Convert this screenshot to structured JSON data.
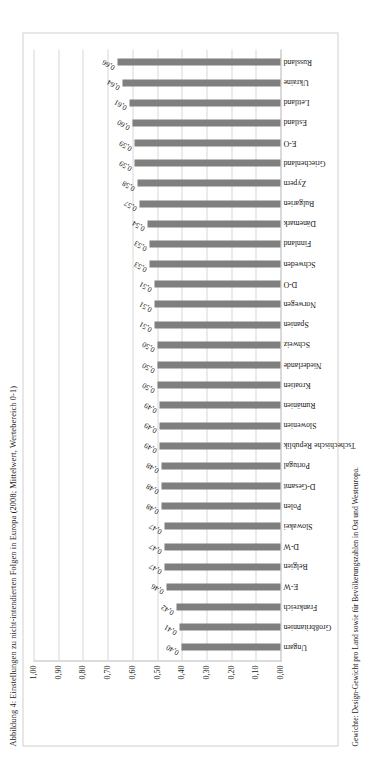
{
  "figure": {
    "title": "Abbildung 4: Einstellungen zu nicht-intendierten Folgen in Europa (2008; Mittelwert, Wertebereich 0-1)",
    "note": "Gewichte: Design-Gewicht pro Land sowie für Bevölkerungszahlen in Ost und Westeuropa."
  },
  "chart_data": {
    "type": "bar",
    "title": "Abbildung 4: Einstellungen zu nicht-intendierten Folgen in Europa (2008; Mittelwert, Wertebereich 0-1)",
    "xlabel": "",
    "ylabel": "",
    "ylim": [
      0,
      1.0
    ],
    "grid": true,
    "legend": false,
    "bar_color": "#7f7f7f",
    "decimal_separator": ",",
    "ytick_labels": [
      "0,00",
      "0,10",
      "0,20",
      "0,30",
      "0,40",
      "0,50",
      "0,60",
      "0,70",
      "0,80",
      "0,90",
      "1,00"
    ],
    "yticks": [
      0.0,
      0.1,
      0.2,
      0.3,
      0.4,
      0.5,
      0.6,
      0.7,
      0.8,
      0.9,
      1.0
    ],
    "categories": [
      "Ungarn",
      "Großbritannien",
      "Frankreich",
      "E-W",
      "Belgien",
      "D-W",
      "Slowakei",
      "Polen",
      "D-Gesamt",
      "Portugal",
      "Tschechische Republik",
      "Slowenien",
      "Rumänien",
      "Kroatien",
      "Niederlande",
      "Schweiz",
      "Spanien",
      "Norwegen",
      "D-O",
      "Schweden",
      "Finnland",
      "Dänemark",
      "Bulgarien",
      "Zypern",
      "Griechenland",
      "E-O",
      "Estland",
      "Lettland",
      "Ukraine",
      "Russland"
    ],
    "values": [
      0.4,
      0.41,
      0.42,
      0.46,
      0.47,
      0.47,
      0.47,
      0.48,
      0.48,
      0.48,
      0.49,
      0.49,
      0.49,
      0.5,
      0.5,
      0.5,
      0.51,
      0.51,
      0.51,
      0.53,
      0.53,
      0.54,
      0.57,
      0.58,
      0.59,
      0.59,
      0.6,
      0.61,
      0.64,
      0.66
    ],
    "value_labels": [
      "0,40",
      "0,41",
      "0,42",
      "0,46",
      "0,47",
      "0,47",
      "0,47",
      "0,48",
      "0,48",
      "0,48",
      "0,49",
      "0,49",
      "0,49",
      "0,50",
      "0,50",
      "0,50",
      "0,51",
      "0,51",
      "0,51",
      "0,53",
      "0,53",
      "0,54",
      "0,57",
      "0,58",
      "0,59",
      "0,59",
      "0,60",
      "0,61",
      "0,64",
      "0,66"
    ]
  }
}
